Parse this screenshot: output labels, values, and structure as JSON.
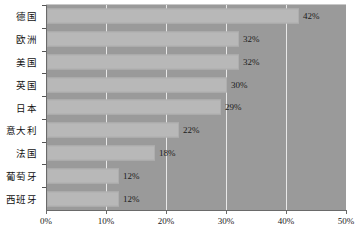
{
  "chart_data": {
    "type": "bar",
    "orientation": "horizontal",
    "title": "",
    "subtitle": "",
    "xlabel": "",
    "ylabel": "",
    "categories": [
      "德国",
      "欧洲",
      "美国",
      "英国",
      "日本",
      "意大利",
      "法国",
      "葡萄牙",
      "西班牙"
    ],
    "values": [
      42,
      32,
      32,
      30,
      29,
      22,
      18,
      12,
      12
    ],
    "value_labels": [
      "42%",
      "32%",
      "32%",
      "30%",
      "29%",
      "22%",
      "18%",
      "12%",
      "12%"
    ],
    "xlim": [
      0,
      50
    ],
    "xticks": [
      0,
      10,
      20,
      30,
      40,
      50
    ],
    "xtick_labels": [
      "0%",
      "10%",
      "20%",
      "30%",
      "40%",
      "50%"
    ],
    "grid": true,
    "grid_axis": "x",
    "legend": false,
    "legend_position": "none",
    "colors": {
      "bar_fill": "#b8b8b8",
      "bar_border": "#aeaeae",
      "plot_background": "#9a9a9a",
      "page_background": "#ffffff",
      "gridline": "#e8e8e8",
      "axis_line": "#6a6a6a",
      "text": "#1a1a1a"
    }
  }
}
